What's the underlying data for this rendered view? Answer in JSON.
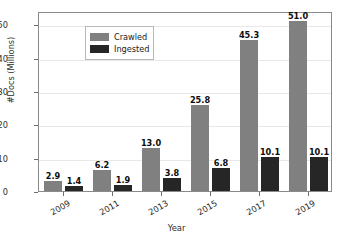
{
  "chart_data": {
    "type": "bar",
    "title": "",
    "xlabel": "Year",
    "ylabel": "#Docs (Millions)",
    "categories": [
      "2009",
      "2011",
      "2013",
      "2015",
      "2017",
      "2019"
    ],
    "series": [
      {
        "name": "Crawled",
        "color": "#808080",
        "values": [
          2.9,
          6.2,
          13.0,
          25.8,
          45.3,
          51.0
        ],
        "labels": [
          "2.9",
          "6.2",
          "13.0",
          "25.8",
          "45.3",
          "51.0"
        ]
      },
      {
        "name": "Ingested",
        "color": "#262626",
        "values": [
          1.4,
          1.9,
          3.8,
          6.8,
          10.1,
          10.1
        ],
        "labels": [
          "1.4",
          "1.9",
          "3.8",
          "6.8",
          "10.1",
          "10.1"
        ]
      }
    ],
    "ylim": [
      0,
      54
    ],
    "yticks": [
      0,
      10,
      20,
      30,
      40,
      50
    ],
    "ytick_labels": [
      "0",
      "10",
      "20",
      "30",
      "40",
      "50"
    ],
    "grid": "horizontal",
    "legend_position": "upper left",
    "xtick_rotation": -30
  },
  "legend": {
    "entries": [
      {
        "label": "Crawled"
      },
      {
        "label": "Ingested"
      }
    ]
  },
  "axes": {
    "x_title": "Year",
    "y_title": "#Docs (Millions)"
  }
}
